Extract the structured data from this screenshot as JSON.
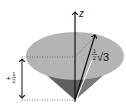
{
  "diagram": {
    "axis_label": "z",
    "projection_label": {
      "sign": "+",
      "numerator": "1",
      "denominator": "2"
    },
    "magnitude_label": {
      "numerator": "1",
      "denominator": "2",
      "radical": "√3"
    },
    "colors": {
      "disc": "#b4b4b4",
      "cone_side": "#5f5f5f",
      "cone_shadow": "#8a8a8a",
      "lines": "#111111",
      "dotted": "#555555"
    }
  }
}
